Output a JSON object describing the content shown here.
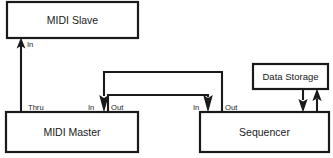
{
  "diagram": {
    "stroke_color": "#1a1a1a",
    "background_color": "#ffffff",
    "boxes": [
      {
        "id": "midi_slave",
        "label": "MIDI Slave",
        "x": 7,
        "y": 2,
        "w": 131,
        "h": 36
      },
      {
        "id": "midi_master",
        "label": "MIDI Master",
        "x": 6,
        "y": 112,
        "w": 132,
        "h": 40
      },
      {
        "id": "sequencer",
        "label": "Sequencer",
        "x": 200,
        "y": 112,
        "w": 129,
        "h": 40
      },
      {
        "id": "data_storage",
        "label": "Data Storage",
        "x": 253,
        "y": 64,
        "w": 75,
        "h": 25
      }
    ],
    "ports": [
      {
        "id": "slave_in",
        "label": "In",
        "owner": "midi_slave",
        "label_x": 27,
        "label_y": 47
      },
      {
        "id": "master_thru",
        "label": "Thru",
        "owner": "midi_master",
        "label_x": 28,
        "label_y": 110
      },
      {
        "id": "master_in",
        "label": "In",
        "owner": "midi_master",
        "label_x": 88,
        "label_y": 110
      },
      {
        "id": "master_out",
        "label": "Out",
        "owner": "midi_master",
        "label_x": 111,
        "label_y": 110
      },
      {
        "id": "sequencer_in",
        "label": "In",
        "owner": "sequencer",
        "label_x": 193,
        "label_y": 110
      },
      {
        "id": "sequencer_out",
        "label": "Out",
        "owner": "sequencer",
        "label_x": 225,
        "label_y": 110
      }
    ],
    "connections": [
      {
        "id": "master_thru_to_slave_in",
        "from": "MIDI Master Thru",
        "to": "MIDI Slave In",
        "direction": "up"
      },
      {
        "id": "sequencer_out_to_master_in",
        "from": "Sequencer Out",
        "to": "MIDI Master In",
        "direction": "down"
      },
      {
        "id": "master_out_to_sequencer_in",
        "from": "MIDI Master Out",
        "to": "Sequencer In",
        "direction": "down"
      },
      {
        "id": "sequencer_to_data_storage",
        "from": "Sequencer",
        "to": "Data Storage",
        "direction": "up"
      },
      {
        "id": "data_storage_to_sequencer",
        "from": "Data Storage",
        "to": "Sequencer",
        "direction": "down"
      }
    ]
  }
}
